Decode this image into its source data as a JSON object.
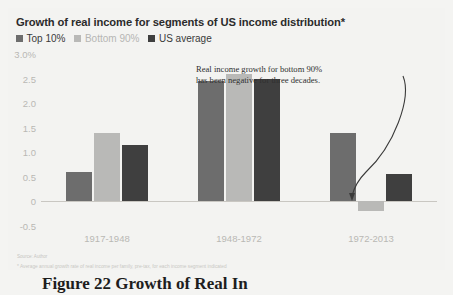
{
  "chart_data": {
    "type": "bar",
    "title": "Growth of real income for segments of US income distribution*",
    "xlabel": "",
    "ylabel": "",
    "categories": [
      "1917-1948",
      "1948-1972",
      "1972-2013"
    ],
    "series": [
      {
        "name": "Top 10%",
        "color": "#6d6d6d",
        "values": [
          0.6,
          2.45,
          1.4
        ]
      },
      {
        "name": "Bottom 90%",
        "color": "#b9b9b7",
        "values": [
          1.4,
          2.6,
          -0.2
        ]
      },
      {
        "name": "US average",
        "color": "#3f3f3f",
        "values": [
          1.15,
          2.5,
          0.55
        ]
      }
    ],
    "ylim": [
      -0.5,
      3.0
    ],
    "yticks": [
      "3.0%",
      "2.5",
      "2.0",
      "1.5",
      "1.0",
      "0.5",
      "0",
      "-0.5"
    ],
    "ytick_values": [
      3.0,
      2.5,
      2.0,
      1.5,
      1.0,
      0.5,
      0,
      -0.5
    ],
    "grid": false,
    "legend_position": "top-left",
    "annotations": [
      {
        "text": "Real income growth for bottom 90% has been negative for three decades.",
        "points_to": "1972-2013 Bottom 90%"
      }
    ]
  },
  "chart": {
    "title": "Growth of real income for segments of US income distribution*",
    "annotation_line1": "Real income growth for bottom 90%",
    "annotation_line2": "has been negative for three decades.",
    "source_note": "Source: Author",
    "footnote": "* Average annual growth rate of real income per family, pre-tax, for each income segment indicated"
  },
  "caption": {
    "text": "Figure 22 Growth of Real In"
  }
}
